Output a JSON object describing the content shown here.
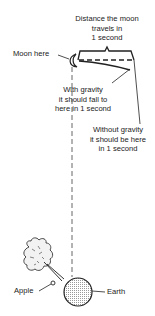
{
  "diagram": {
    "title_label": {
      "line1": "Distance the moon",
      "line2": "travels in",
      "line3": "1 second"
    },
    "moon_label": "Moon here",
    "with_gravity_label": {
      "line1": "With gravity",
      "line2": "it should fall to",
      "line3": "here in 1 second"
    },
    "without_gravity_label": {
      "line1": "Without gravity",
      "line2": "it should be here",
      "line3": "in 1 second"
    },
    "apple_label": "Apple",
    "earth_label": "Earth",
    "colors": {
      "ink": "#222222",
      "earth_fill": "#d8d8d8",
      "background": "#ffffff"
    }
  }
}
